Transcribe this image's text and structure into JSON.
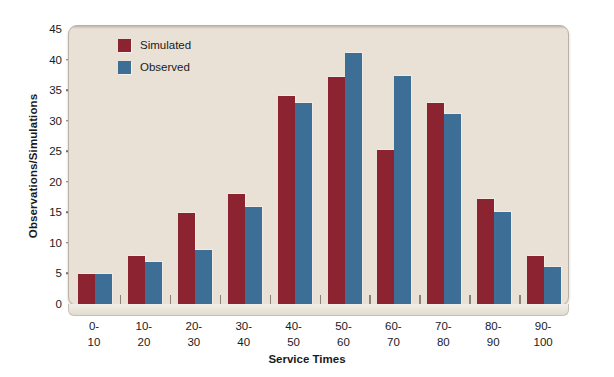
{
  "chart_data": {
    "type": "bar",
    "title": "",
    "xlabel": "Service Times",
    "ylabel": "Observations/Simulations",
    "categories": [
      "0-10",
      "10-20",
      "20-30",
      "30-40",
      "40-50",
      "50-60",
      "60-70",
      "70-80",
      "80-90",
      "90-100"
    ],
    "category_lines": [
      [
        "0-",
        "10"
      ],
      [
        "10-",
        "20"
      ],
      [
        "20-",
        "30"
      ],
      [
        "30-",
        "40"
      ],
      [
        "40-",
        "50"
      ],
      [
        "50-",
        "60"
      ],
      [
        "60-",
        "70"
      ],
      [
        "70-",
        "80"
      ],
      [
        "80-",
        "90"
      ],
      [
        "90-",
        "100"
      ]
    ],
    "series": [
      {
        "name": "Simulated",
        "color": "#8b2331",
        "values": [
          5.0,
          8.0,
          15.1,
          18.1,
          34.2,
          37.3,
          25.4,
          33.0,
          17.3,
          8.1
        ]
      },
      {
        "name": "Observed",
        "color": "#3d6e95",
        "values": [
          5.0,
          7.0,
          9.0,
          16.0,
          33.0,
          41.2,
          37.4,
          31.3,
          15.2,
          6.2
        ]
      }
    ],
    "ylim": [
      0,
      45
    ],
    "yticks": [
      0,
      5,
      10,
      15,
      20,
      25,
      30,
      35,
      40,
      45
    ],
    "ytick_labels": [
      "0",
      "5",
      "10",
      "15",
      "20",
      "25",
      "30",
      "35",
      "40",
      "45"
    ],
    "grid": false,
    "legend_position": "top-left",
    "plot_background": "#e9e1d6",
    "page_background": "#ffffff"
  },
  "legend": {
    "items": [
      {
        "label": "Simulated",
        "color": "#8b2331",
        "swatch_name": "legend-swatch-simulated"
      },
      {
        "label": "Observed",
        "color": "#3d6e95",
        "swatch_name": "legend-swatch-observed"
      }
    ]
  },
  "axes": {
    "y_title": "Observations/Simulations",
    "x_title": "Service Times"
  }
}
